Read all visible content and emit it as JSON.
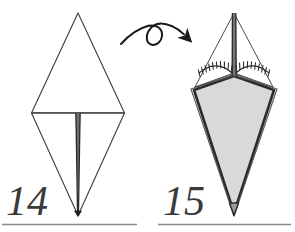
{
  "figure": {
    "type": "instruction-diagram",
    "background_color": "#ffffff"
  },
  "steps": [
    {
      "number": "14",
      "label_position": "bottom-left",
      "shape": "kite-diamond-outline",
      "description": "Thin-outlined diamond with horizontal crease line across the middle and a thick vertical center line running from the middle down to the bottom point.",
      "fill": "none",
      "outline_color": "#3c3c3c"
    },
    {
      "number": "15",
      "label_position": "bottom-right",
      "shape": "kite-diamond-filled",
      "description": "Diamond with thin upper triangle edges, a thick vertical line from the apex to the center, a hatched raw-edge marking forming a shallow V, and a large grey-filled kite body with heavy dark outlines.",
      "fill": "#d9d9d9",
      "outline_color": "#2b2b2b"
    }
  ],
  "arrow": {
    "name": "turn-over-arrow",
    "type": "flip-loop-arrow",
    "direction": "left-to-right",
    "color": "#1a1a1a",
    "meaning": "turn the model over"
  },
  "rules": [
    {
      "name": "left-rule",
      "color": "#8a8a8a"
    },
    {
      "name": "right-rule",
      "color": "#8a8a8a"
    }
  ],
  "colors": {
    "paper_front": "#ffffff",
    "paper_back": "#d9d9d9",
    "line_thin": "#3c3c3c",
    "line_thick": "#2b2b2b",
    "number_ink": "#3a3a3a",
    "rule_grey": "#8a8a8a",
    "arrow_ink": "#1a1a1a"
  }
}
